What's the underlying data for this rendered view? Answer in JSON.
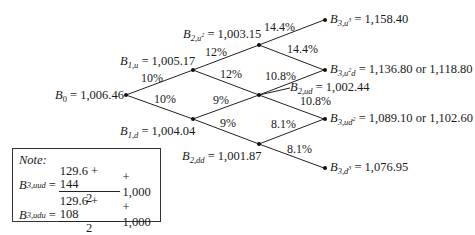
{
  "nodes": {
    "b0": {
      "sym": "B",
      "sub": "0",
      "sub_sup": "",
      "value": "1,006.46"
    },
    "b1u": {
      "sym": "B",
      "sub": "1,u",
      "sub_sup": "",
      "value": "1,005.17"
    },
    "b1d": {
      "sym": "B",
      "sub": "1,d",
      "sub_sup": "",
      "value": "1,004.04"
    },
    "b2uu": {
      "sym": "B",
      "sub": "2,u",
      "sub_sup": "2",
      "value": "1,003.15"
    },
    "b2ud": {
      "sym": "B",
      "sub": "2,ud",
      "sub_sup": "",
      "value": "1,002.44"
    },
    "b2dd": {
      "sym": "B",
      "sub": "2,dd",
      "sub_sup": "",
      "value": "1,001.87"
    },
    "b3uuu": {
      "sym": "B",
      "sub": "3,u",
      "sub_sup": "3",
      "value": "1,158.40"
    },
    "b3uud": {
      "sym": "B",
      "sub": "3,u",
      "sub_sup": "2",
      "sub_tail": "d",
      "value": "1,136.80 or 1,118.80"
    },
    "b3udd": {
      "sym": "B",
      "sub": "3,ud",
      "sub_sup": "2",
      "value": "1,089.10 or 1,102.60"
    },
    "b3ddd": {
      "sym": "B",
      "sub": "3,d",
      "sub_sup": "3",
      "value": "1,076.95"
    }
  },
  "rates": {
    "b0_up": "10%",
    "b0_down": "10%",
    "b1u_up": "12%",
    "b1u_down": "12%",
    "b1d_up": "9%",
    "b1d_down": "9%",
    "b2uu_up": "14.4%",
    "b2uu_down": "14.4%",
    "b2ud_up": "10.8%",
    "b2ud_down": "10.8%",
    "b2dd_up": "8.1%",
    "b2dd_down": "8.1%"
  },
  "note": {
    "title": "Note:",
    "eq1": {
      "sym": "B",
      "sub": "3,uud",
      "num": "129.6 + 144",
      "den": "2",
      "tail": "+ 1,000"
    },
    "eq2": {
      "sym": "B",
      "sub": "3,udu",
      "num": "129.6 + 108",
      "den": "2",
      "tail": "+ 1,000"
    }
  }
}
